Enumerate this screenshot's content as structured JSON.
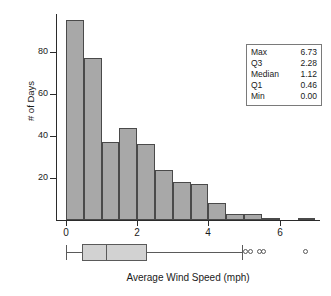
{
  "chart_data": {
    "type": "bar",
    "title": "",
    "xlabel": "Average Wind Speed (mph)",
    "ylabel": "# of Days",
    "xlim": [
      -0.25,
      7.1
    ],
    "ylim": [
      0,
      98
    ],
    "grid": false,
    "bin_width": 0.5,
    "categories": [
      "0.0-0.5",
      "0.5-1.0",
      "1.0-1.5",
      "1.5-2.0",
      "2.0-2.5",
      "2.5-3.0",
      "3.0-3.5",
      "3.5-4.0",
      "4.0-4.5",
      "4.5-5.0",
      "5.0-5.5",
      "5.5-6.0",
      "6.5-7.0"
    ],
    "bin_starts": [
      0.0,
      0.5,
      1.0,
      1.5,
      2.0,
      2.5,
      3.0,
      3.5,
      4.0,
      4.5,
      5.0,
      5.5,
      6.5
    ],
    "values": [
      95,
      77,
      37,
      44,
      36,
      24,
      18,
      17,
      8,
      3,
      3,
      1,
      1
    ],
    "x_ticks": [
      0,
      2,
      4,
      6
    ],
    "x_tick_labels": [
      "0",
      "2",
      "4",
      "6"
    ],
    "y_ticks": [
      20,
      40,
      60,
      80
    ],
    "y_tick_labels": [
      "20",
      "40",
      "60",
      "80"
    ],
    "bar_fill": "#a8a8a8",
    "bar_stroke": "#4a4a4a"
  },
  "boxplot": {
    "type": "boxplot",
    "min": 0.0,
    "q1": 0.46,
    "median": 1.12,
    "q3": 2.28,
    "upper_whisker": 4.95,
    "outliers": [
      5.05,
      5.18,
      5.42,
      5.55,
      6.73
    ],
    "box_fill": "#d2d2d2",
    "stroke": "#5a5a5a"
  },
  "stats_box": {
    "rows": [
      {
        "label": "Max",
        "value": "6.73"
      },
      {
        "label": "Q3",
        "value": "2.28"
      },
      {
        "label": "Median",
        "value": "1.12"
      },
      {
        "label": "Q1",
        "value": "0.46"
      },
      {
        "label": "Min",
        "value": "0.00"
      }
    ]
  }
}
